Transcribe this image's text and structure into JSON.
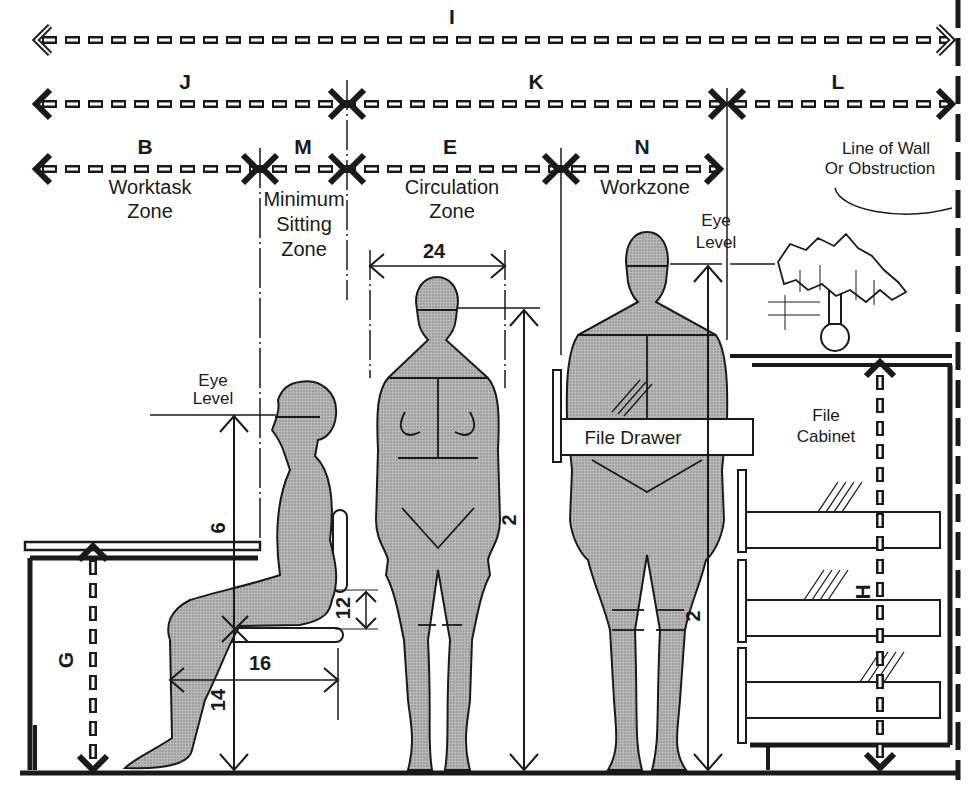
{
  "diagram": {
    "colors": {
      "ink": "#1a1a1a",
      "figure_fill": "#a8a8a8",
      "background": "#ffffff"
    },
    "dimension_rows": {
      "row1": [
        {
          "letter": "I"
        }
      ],
      "row2": [
        {
          "letter": "J"
        },
        {
          "letter": "K"
        },
        {
          "letter": "L"
        }
      ],
      "row3": [
        {
          "letter": "B",
          "name_line1": "Worktask",
          "name_line2": "Zone"
        },
        {
          "letter": "M",
          "name_line1": "Minimum",
          "name_line2": "Sitting",
          "name_line3": "Zone"
        },
        {
          "letter": "E",
          "name_line1": "Circulation",
          "name_line2": "Zone"
        },
        {
          "letter": "N",
          "name_line1": "Workzone"
        }
      ]
    },
    "wall_note": {
      "line1": "Line of Wall",
      "line2": "Or Obstruction"
    },
    "seated": {
      "eye_level_line1": "Eye",
      "eye_level_line2": "Level",
      "dim_eye_height": "6",
      "dim_seat_depth": "16",
      "dim_seat_height": "14",
      "dim_thigh": "12",
      "desk_height_letter": "G"
    },
    "standing_female": {
      "dim_shoulder_width": "24",
      "dim_eye_height": "2"
    },
    "standing_male": {
      "eye_level_line1": "Eye",
      "eye_level_line2": "Level",
      "dim_eye_height": "2",
      "file_drawer_label": "File Drawer"
    },
    "cabinet": {
      "label_line1": "File",
      "label_line2": "Cabinet",
      "height_letter": "H"
    }
  }
}
